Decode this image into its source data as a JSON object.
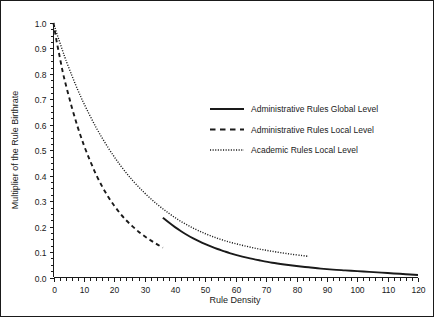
{
  "chart_data": {
    "type": "line",
    "title": "",
    "xlabel": "Rule Density",
    "ylabel": "Multiplier of the Rule Birthrate",
    "xlim": [
      0,
      120
    ],
    "ylim": [
      0.0,
      1.0
    ],
    "grid": false,
    "legend_position": "upper-center-right",
    "xticks": [
      0,
      10,
      20,
      30,
      40,
      50,
      60,
      70,
      80,
      90,
      100,
      110,
      120
    ],
    "xtick_labels": [
      "0",
      "10",
      "20",
      "30",
      "40",
      "50",
      "60",
      "70",
      "80",
      "90",
      "100",
      "110",
      "120"
    ],
    "x_minor_tick_step": 2,
    "yticks": [
      0.0,
      0.1,
      0.2,
      0.3,
      0.4,
      0.5,
      0.6,
      0.7,
      0.8,
      0.9,
      1.0
    ],
    "ytick_labels": [
      "0.0",
      "0.1",
      "0.2",
      "0.3",
      "0.4",
      "0.5",
      "0.6",
      "0.7",
      "0.8",
      "0.9",
      "1.0"
    ],
    "y_minor_tick_step": 0.025,
    "series": [
      {
        "name": "Administrative Rules Global Level",
        "style": "solid",
        "color": "#1a1a1a",
        "x": [
          36,
          38,
          40,
          42,
          44,
          46,
          48,
          50,
          52,
          54,
          56,
          58,
          60,
          64,
          68,
          72,
          76,
          80,
          84,
          88,
          92,
          96,
          100,
          104,
          108,
          112,
          116,
          120
        ],
        "y": [
          0.235,
          0.216,
          0.198,
          0.182,
          0.167,
          0.154,
          0.142,
          0.131,
          0.121,
          0.112,
          0.104,
          0.096,
          0.089,
          0.077,
          0.067,
          0.058,
          0.051,
          0.045,
          0.04,
          0.035,
          0.031,
          0.028,
          0.025,
          0.022,
          0.019,
          0.016,
          0.013,
          0.01
        ]
      },
      {
        "name": "Administrative Rules Local Level",
        "style": "dashed",
        "color": "#1a1a1a",
        "x": [
          0,
          1,
          2,
          3,
          4,
          6,
          8,
          10,
          12,
          14,
          16,
          18,
          20,
          22,
          24,
          26,
          28,
          30,
          32,
          34,
          36
        ],
        "y": [
          1.0,
          0.93,
          0.87,
          0.81,
          0.76,
          0.67,
          0.59,
          0.52,
          0.46,
          0.405,
          0.358,
          0.317,
          0.282,
          0.251,
          0.224,
          0.201,
          0.18,
          0.162,
          0.146,
          0.131,
          0.117
        ]
      },
      {
        "name": "Academic Rules Local Level",
        "style": "dotted",
        "color": "#1a1a1a",
        "x": [
          0,
          1,
          2,
          3,
          4,
          6,
          8,
          10,
          14,
          18,
          22,
          26,
          30,
          34,
          38,
          42,
          46,
          50,
          54,
          58,
          62,
          66,
          70,
          74,
          78,
          82,
          84
        ],
        "y": [
          1.0,
          0.962,
          0.926,
          0.891,
          0.857,
          0.795,
          0.737,
          0.684,
          0.59,
          0.51,
          0.441,
          0.382,
          0.332,
          0.289,
          0.252,
          0.22,
          0.194,
          0.172,
          0.154,
          0.139,
          0.127,
          0.116,
          0.107,
          0.099,
          0.092,
          0.086,
          0.083
        ]
      }
    ],
    "legend_entries": [
      "Administrative Rules Global Level",
      "Administrative Rules Local Level",
      "Academic Rules Local Level"
    ]
  }
}
